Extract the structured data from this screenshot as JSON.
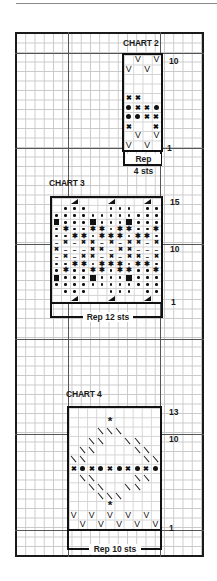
{
  "colors": {
    "ink": "#111111",
    "grid_minor": "#c9c9c9",
    "grid_major": "#555555",
    "paper": "#ffffff"
  },
  "symbols": {
    "V": "V",
    "X": "✖",
    "dot": "•",
    "bullet": "●",
    "star": "✱",
    "dash": "–",
    "square": "■",
    "triangle": "◢",
    "slash": "\\",
    "asterisk": "*"
  },
  "charts": [
    {
      "id": "chart2",
      "title": "CHART 2",
      "stitches": 4,
      "rows": 10,
      "top_row_label": "10",
      "bottom_row_label": "1",
      "rep_label_line1": "Rep",
      "rep_label_line2": "4 sts",
      "grid": [
        [
          "",
          "V",
          "",
          "V"
        ],
        [
          "V",
          "",
          "V",
          ""
        ],
        [
          "",
          "",
          "",
          ""
        ],
        [
          "",
          "",
          "",
          ""
        ],
        [
          "X",
          "X",
          "",
          ""
        ],
        [
          "bullet",
          "X",
          "X",
          "bullet"
        ],
        [
          "bullet",
          "bullet",
          "X",
          "X"
        ],
        [
          "X",
          "",
          "",
          "X"
        ],
        [
          "",
          "V",
          "",
          "V"
        ],
        [
          "V",
          "",
          "V",
          ""
        ]
      ]
    },
    {
      "id": "chart3",
      "title": "CHART 3",
      "stitches": 12,
      "rows": 15,
      "top_row_label": "15",
      "mid_row_label": "10",
      "bottom_row_label": "1",
      "rep_label": "Rep 12 sts",
      "grid": [
        [
          "",
          "",
          "tri",
          "",
          "",
          "",
          "tri",
          "",
          "",
          "",
          "tri",
          ""
        ],
        [
          "",
          "dot",
          "dot",
          "dot",
          "",
          "",
          "dot",
          "dot",
          "dot",
          "",
          "dot",
          "dot"
        ],
        [
          "dot",
          "dot",
          "dot",
          "dot",
          "dot",
          "dot",
          "dot",
          "dot",
          "dot",
          "dot",
          "dot",
          "dot"
        ],
        [
          "sq",
          "dot",
          "dot",
          "dot",
          "sq",
          "dot",
          "dot",
          "dot",
          "sq",
          "dot",
          "dot",
          "dot"
        ],
        [
          "dot",
          "star",
          "dot",
          "dot",
          "star",
          "star",
          "dot",
          "star",
          "star",
          "dot",
          "dot",
          "star"
        ],
        [
          "dot",
          "dot",
          "star",
          "star",
          "dot",
          "star",
          "star",
          "star",
          "dot",
          "star",
          "star",
          "dot"
        ],
        [
          "dash",
          "X",
          "dash",
          "X",
          "X",
          "dash",
          "X",
          "dash",
          "X",
          "X",
          "dash",
          "X"
        ],
        [
          "X",
          "dash",
          "dash",
          "dash",
          "X",
          "X",
          "dash",
          "X",
          "X",
          "dash",
          "dash",
          "dash"
        ],
        [
          "dash",
          "X",
          "dash",
          "X",
          "X",
          "dash",
          "X",
          "dash",
          "X",
          "X",
          "dash",
          "X"
        ],
        [
          "dot",
          "dot",
          "star",
          "star",
          "dot",
          "star",
          "star",
          "star",
          "dot",
          "star",
          "star",
          "dot"
        ],
        [
          "dot",
          "star",
          "dot",
          "dot",
          "star",
          "star",
          "dot",
          "star",
          "star",
          "dot",
          "dot",
          "star"
        ],
        [
          "sq",
          "dot",
          "dot",
          "dot",
          "sq",
          "dot",
          "dot",
          "dot",
          "sq",
          "dot",
          "dot",
          "dot"
        ],
        [
          "dot",
          "dot",
          "dot",
          "dot",
          "dot",
          "dot",
          "dot",
          "dot",
          "dot",
          "dot",
          "dot",
          "dot"
        ],
        [
          "",
          "dot",
          "dot",
          "dot",
          "",
          "",
          "dot",
          "dot",
          "dot",
          "",
          "dot",
          "dot"
        ],
        [
          "",
          "",
          "tri",
          "",
          "",
          "",
          "tri",
          "",
          "",
          "",
          "tri",
          ""
        ]
      ]
    },
    {
      "id": "chart4",
      "title": "CHART 4",
      "stitches": 10,
      "rows": 13,
      "top_row_label": "13",
      "mid_row_label": "10",
      "bottom_row_label": "1",
      "rep_label": "Rep 10 sts",
      "grid": [
        [
          "",
          "",
          "",
          "",
          "",
          "",
          "",
          "",
          "",
          ""
        ],
        [
          "",
          "",
          "",
          "",
          "asterisk",
          "",
          "",
          "",
          "",
          ""
        ],
        [
          "",
          "",
          "",
          "slash",
          "slash",
          "slash",
          "",
          "",
          "",
          ""
        ],
        [
          "",
          "",
          "slash",
          "slash",
          "",
          "",
          "slash",
          "slash",
          "",
          ""
        ],
        [
          "",
          "slash",
          "slash",
          "",
          "",
          "",
          "",
          "slash",
          "slash",
          ""
        ],
        [
          "slash",
          "slash",
          "",
          "",
          "",
          "",
          "",
          "",
          "slash",
          "slash"
        ],
        [
          "X",
          "bullet",
          "X",
          "bullet",
          "X",
          "bullet",
          "X",
          "bullet",
          "X",
          "bullet"
        ],
        [
          "",
          "slash",
          "slash",
          "",
          "",
          "",
          "",
          "slash",
          "slash",
          ""
        ],
        [
          "",
          "",
          "slash",
          "slash",
          "",
          "",
          "slash",
          "slash",
          "",
          ""
        ],
        [
          "",
          "",
          "",
          "slash",
          "slash",
          "slash",
          "",
          "",
          "",
          ""
        ],
        [
          "",
          "",
          "",
          "",
          "asterisk",
          "",
          "",
          "",
          "",
          ""
        ],
        [
          "V",
          "",
          "V",
          "",
          "V",
          "",
          "V",
          "",
          "V",
          ""
        ],
        [
          "",
          "V",
          "",
          "V",
          "",
          "V",
          "",
          "V",
          "",
          "V"
        ]
      ]
    }
  ]
}
